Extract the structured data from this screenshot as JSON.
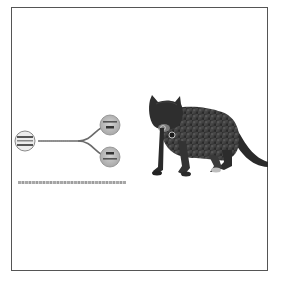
{
  "figure": {
    "type": "diagram-with-photo",
    "frame_color": "#555555",
    "background": "#ffffff"
  },
  "diagram": {
    "nodes": [
      {
        "id": "source",
        "label": "",
        "shape": "circle",
        "cx": 25,
        "cy": 141,
        "r": 10
      },
      {
        "id": "branch-top",
        "label": "",
        "shape": "circle",
        "cx": 110,
        "cy": 125,
        "r": 10
      },
      {
        "id": "branch-bottom",
        "label": "",
        "shape": "circle",
        "cx": 110,
        "cy": 157,
        "r": 10
      }
    ],
    "edges": [
      {
        "from": "source",
        "to": "branch-top"
      },
      {
        "from": "source",
        "to": "branch-bottom"
      }
    ],
    "node_fill": "#b8b8b8",
    "edge_color": "#6a6a6a",
    "caption": ""
  },
  "photo": {
    "subject": "cat",
    "description": "Tabby cat standing, facing left, wearing a collar with a tag",
    "accessory": "collar-tag"
  }
}
